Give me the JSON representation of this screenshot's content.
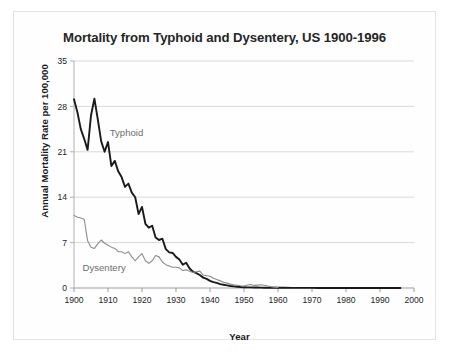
{
  "figure": {
    "title": "Mortality from Typhoid and Dysentery, US 1900-1996",
    "xlabel_text": "Year",
    "ylabel_text": "Annual Mortality Rate per 100,000"
  },
  "chart_data": {
    "type": "line",
    "title": "Mortality from Typhoid and Dysentery, US 1900-1996",
    "xlabel": "Year",
    "ylabel": "Annual Mortality Rate per 100,000",
    "xlim": [
      1900,
      2000
    ],
    "ylim": [
      0,
      35
    ],
    "xticks": [
      1900,
      1910,
      1920,
      1930,
      1940,
      1950,
      1960,
      1970,
      1980,
      1990,
      2000
    ],
    "yticks": [
      0,
      7,
      14,
      21,
      28,
      35
    ],
    "grid": "horizontal",
    "legend": "inline-annotations",
    "annotations": [
      {
        "text": "Typhoid",
        "x": 1910.5,
        "y": 23.5,
        "color": "#6e6e6e"
      },
      {
        "text": "Dysentery",
        "x": 1902.5,
        "y": 2.6,
        "color": "#6e6e6e"
      }
    ],
    "series": [
      {
        "name": "Typhoid",
        "color": "#1a1a1a",
        "width": 1.9,
        "x": [
          1900,
          1901,
          1902,
          1903,
          1904,
          1905,
          1906,
          1907,
          1908,
          1909,
          1910,
          1911,
          1912,
          1913,
          1914,
          1915,
          1916,
          1917,
          1918,
          1919,
          1920,
          1921,
          1922,
          1923,
          1924,
          1925,
          1926,
          1927,
          1928,
          1929,
          1930,
          1931,
          1932,
          1933,
          1934,
          1935,
          1936,
          1937,
          1938,
          1939,
          1940,
          1941,
          1942,
          1943,
          1944,
          1945,
          1946,
          1947,
          1948,
          1949,
          1950,
          1951,
          1952,
          1953,
          1954,
          1955,
          1956,
          1957,
          1958,
          1959,
          1960,
          1962,
          1964,
          1966,
          1968,
          1970,
          1972,
          1974,
          1976,
          1978,
          1980,
          1982,
          1984,
          1986,
          1988,
          1990,
          1992,
          1994,
          1996
        ],
        "values": [
          29.1,
          27.1,
          24.5,
          23.0,
          21.3,
          26.6,
          29.2,
          26.0,
          22.6,
          21.0,
          22.5,
          18.8,
          19.6,
          18.0,
          17.1,
          15.6,
          16.1,
          14.7,
          14.0,
          11.4,
          12.5,
          9.9,
          9.3,
          9.6,
          7.8,
          7.4,
          7.6,
          6.0,
          5.5,
          5.4,
          4.8,
          4.4,
          3.6,
          3.9,
          3.0,
          2.5,
          2.3,
          2.0,
          1.6,
          1.4,
          1.1,
          0.9,
          0.8,
          0.6,
          0.5,
          0.4,
          0.3,
          0.25,
          0.2,
          0.15,
          0.12,
          0.1,
          0.09,
          0.08,
          0.07,
          0.06,
          0.05,
          0.05,
          0.04,
          0.04,
          0.03,
          0.03,
          0.02,
          0.02,
          0.02,
          0.02,
          0.01,
          0.01,
          0.01,
          0.01,
          0.01,
          0.01,
          0.01,
          0.01,
          0.01,
          0.01,
          0.01,
          0.01,
          0.01
        ]
      },
      {
        "name": "Dysentery",
        "color": "#8c8c8c",
        "width": 1.1,
        "x": [
          1900,
          1901,
          1902,
          1903,
          1904,
          1905,
          1906,
          1907,
          1908,
          1909,
          1910,
          1911,
          1912,
          1913,
          1914,
          1915,
          1916,
          1917,
          1918,
          1919,
          1920,
          1921,
          1922,
          1923,
          1924,
          1925,
          1926,
          1927,
          1928,
          1929,
          1930,
          1931,
          1932,
          1933,
          1934,
          1935,
          1936,
          1937,
          1938,
          1939,
          1940,
          1941,
          1942,
          1943,
          1944,
          1945,
          1946,
          1947,
          1948,
          1949,
          1950,
          1951,
          1952,
          1953,
          1954,
          1955,
          1956,
          1957,
          1958,
          1959,
          1960
        ],
        "values": [
          11.2,
          10.9,
          10.8,
          10.6,
          7.3,
          6.3,
          6.1,
          6.8,
          7.4,
          6.9,
          6.6,
          6.3,
          6.1,
          5.6,
          5.6,
          5.3,
          5.6,
          4.8,
          4.2,
          4.8,
          5.3,
          4.2,
          3.8,
          4.2,
          5.0,
          4.8,
          4.0,
          3.6,
          3.4,
          3.2,
          3.2,
          3.1,
          2.7,
          2.8,
          2.6,
          2.4,
          2.5,
          2.6,
          2.0,
          1.9,
          1.8,
          1.5,
          1.3,
          1.1,
          0.9,
          0.75,
          0.6,
          0.5,
          0.42,
          0.35,
          0.3,
          0.45,
          0.55,
          0.4,
          0.45,
          0.5,
          0.42,
          0.3,
          0.2,
          0.14,
          0.1
        ]
      }
    ]
  }
}
